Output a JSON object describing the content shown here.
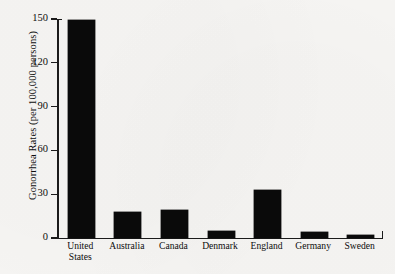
{
  "chart_data": {
    "type": "bar",
    "title": "",
    "xlabel": "",
    "ylabel": "Gonorrhea Rates (per 100,000 persons)",
    "categories": [
      "United States",
      "Australia",
      "Canada",
      "Denmark",
      "England",
      "Germany",
      "Sweden"
    ],
    "category_lines": [
      [
        "United",
        "States"
      ],
      [
        "Australia"
      ],
      [
        "Canada"
      ],
      [
        "Denmark"
      ],
      [
        "England"
      ],
      [
        "Germany"
      ],
      [
        "Sweden"
      ]
    ],
    "values": [
      149,
      18,
      19,
      5,
      33,
      4,
      2
    ],
    "ylim": [
      0,
      150
    ],
    "yticks": [
      0,
      30,
      60,
      90,
      120,
      150
    ],
    "ytick_labels": [
      "0",
      "30",
      "60",
      "90",
      "120",
      "150"
    ],
    "grid": false,
    "legend": false,
    "bar_color": "#0a0a0a",
    "background_color": "#f6f5f3",
    "axis_color": "#1b1b1b"
  }
}
